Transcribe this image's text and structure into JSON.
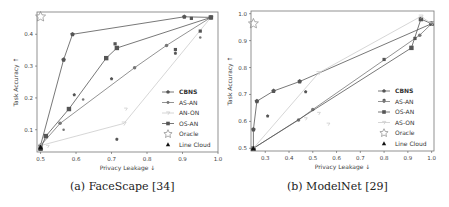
{
  "figure": {
    "panels": [
      {
        "caption": "(a) FaceScape [34]"
      },
      {
        "caption": "(b) ModelNet [29]"
      }
    ]
  },
  "chart_data": [
    {
      "type": "line",
      "title": "FaceScape",
      "caption": "(a) FaceScape [34]",
      "xlabel": "Privacy Leakage ↓",
      "ylabel": "Task Accuracy ↑",
      "xlim": [
        0.49,
        1.0
      ],
      "ylim": [
        0.03,
        0.47
      ],
      "xticks": [
        0.5,
        0.6,
        0.7,
        0.8,
        0.9,
        1.0
      ],
      "yticks": [
        0.1,
        0.2,
        0.3,
        0.4
      ],
      "grid": false,
      "legend_position": "lower right",
      "legend": [
        "CBNS",
        "AS-AN",
        "AN-ON",
        "OS-AN",
        "Oracle",
        "Line Cloud"
      ],
      "series": [
        {
          "name": "CBNS",
          "marker": "pentagon",
          "color": "#555555",
          "bold": true,
          "points": [
            [
              0.5,
              0.05
            ],
            [
              0.565,
              0.32
            ],
            [
              0.59,
              0.4
            ],
            [
              0.905,
              0.455
            ],
            [
              0.98,
              0.453
            ]
          ],
          "scatter": [
            [
              0.595,
              0.21
            ],
            [
              0.7,
              0.26
            ],
            [
              0.715,
              0.07
            ],
            [
              0.88,
              0.34
            ]
          ]
        },
        {
          "name": "AS-AN",
          "marker": "dot",
          "color": "#777777",
          "points": [
            [
              0.5,
              0.05
            ],
            [
              0.555,
              0.12
            ],
            [
              0.765,
              0.295
            ],
            [
              0.855,
              0.365
            ],
            [
              0.98,
              0.453
            ]
          ],
          "scatter": [
            [
              0.565,
              0.1
            ],
            [
              0.62,
              0.195
            ],
            [
              0.95,
              0.39
            ]
          ]
        },
        {
          "name": "AN-ON",
          "marker": "tri",
          "color": "#cccccc",
          "points": [
            [
              0.5,
              0.05
            ],
            [
              0.735,
              0.12
            ],
            [
              0.98,
              0.453
            ]
          ],
          "scatter": [
            [
              0.74,
              0.165
            ],
            [
              0.52,
              0.048
            ]
          ]
        },
        {
          "name": "OS-AN",
          "marker": "square",
          "color": "#555555",
          "points": [
            [
              0.5,
              0.04
            ],
            [
              0.515,
              0.08
            ],
            [
              0.58,
              0.165
            ],
            [
              0.685,
              0.325
            ],
            [
              0.715,
              0.357
            ],
            [
              0.98,
              0.453
            ]
          ],
          "scatter": [
            [
              0.71,
              0.37
            ],
            [
              0.88,
              0.352
            ],
            [
              0.95,
              0.41
            ],
            [
              0.925,
              0.45
            ]
          ]
        },
        {
          "name": "Oracle",
          "marker": "star",
          "color": "#888888",
          "points": [
            [
              0.5,
              0.455
            ]
          ]
        },
        {
          "name": "Line Cloud",
          "marker": "triangle",
          "color": "#111111",
          "points": [
            [
              0.5,
              0.045
            ]
          ]
        }
      ]
    },
    {
      "type": "line",
      "title": "ModelNet",
      "caption": "(b) ModelNet [29]",
      "xlabel": "Privacy Leakage ↓",
      "ylabel": "Task Accuracy ↑",
      "xlim": [
        0.24,
        1.01
      ],
      "ylim": [
        0.49,
        1.01
      ],
      "xticks": [
        0.3,
        0.4,
        0.5,
        0.6,
        0.7,
        0.8,
        0.9,
        1.0
      ],
      "yticks": [
        0.5,
        0.6,
        0.7,
        0.8,
        0.9,
        1.0
      ],
      "grid": false,
      "legend_position": "lower right",
      "legend": [
        "CBNS",
        "AS-AN",
        "OS-AN",
        "AS-ON",
        "Oracle",
        "Line Cloud"
      ],
      "series": [
        {
          "name": "CBNS",
          "marker": "pentagon",
          "color": "#555555",
          "bold": true,
          "points": [
            [
              0.25,
              0.5
            ],
            [
              0.25,
              0.57
            ],
            [
              0.265,
              0.675
            ],
            [
              0.335,
              0.713
            ],
            [
              0.445,
              0.748
            ],
            [
              1.0,
              0.963
            ]
          ],
          "scatter": [
            [
              0.31,
              0.62
            ],
            [
              0.47,
              0.71
            ],
            [
              0.8,
              0.678
            ]
          ]
        },
        {
          "name": "AS-AN",
          "marker": "dot",
          "color": "#777777",
          "points": [
            [
              0.25,
              0.5
            ],
            [
              0.44,
              0.605
            ],
            [
              0.5,
              0.644
            ],
            [
              0.95,
              0.92
            ],
            [
              1.0,
              0.963
            ]
          ],
          "scatter": [
            [
              0.93,
              0.91
            ]
          ]
        },
        {
          "name": "OS-AN",
          "marker": "square",
          "color": "#555555",
          "points": [
            [
              0.25,
              0.5
            ],
            [
              0.915,
              0.873
            ],
            [
              0.955,
              0.98
            ],
            [
              1.0,
              0.963
            ]
          ],
          "scatter": [
            [
              0.8,
              0.83
            ],
            [
              0.93,
              0.908
            ]
          ]
        },
        {
          "name": "AS-ON",
          "marker": "tri",
          "color": "#cccccc",
          "points": [
            [
              0.25,
              0.5
            ],
            [
              0.525,
              0.78
            ],
            [
              0.955,
              0.99
            ],
            [
              1.0,
              0.963
            ]
          ],
          "scatter": [
            [
              0.47,
              0.61
            ],
            [
              0.525,
              0.63
            ],
            [
              0.565,
              0.59
            ]
          ]
        },
        {
          "name": "Oracle",
          "marker": "star",
          "color": "#888888",
          "points": [
            [
              0.25,
              0.963
            ]
          ]
        },
        {
          "name": "Line Cloud",
          "marker": "triangle",
          "color": "#111111",
          "points": [
            [
              0.25,
              0.5
            ]
          ]
        }
      ]
    }
  ]
}
